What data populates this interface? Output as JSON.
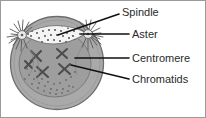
{
  "figure": {
    "background_color": "#ffffff",
    "border_color": "#9a9a9a",
    "cell": {
      "name": "dividing-cell",
      "fill_color": "#a9a9a9",
      "outline_color": "#6e6e6e",
      "center_x": 56,
      "center_y": 62,
      "radius": 47
    },
    "nucleus": {
      "name": "nuclear-region",
      "fill_color": "#9c9c9c",
      "outline_color": "#7a7a7a"
    },
    "spindle_shape": {
      "name": "spindle-apparatus",
      "fill_color": "#f2f2f2",
      "outline_color": "#777777",
      "stipple_color": "#4a4a4a"
    },
    "aster_color": "#5a5a5a",
    "aster_center_fill": "#e8e8e8",
    "chromosome_color": "#4e4e4e"
  },
  "labels": [
    {
      "id": "spindle",
      "text": "Spindle",
      "x": 121,
      "y": 12,
      "leader": "M 57,34 L 118,13"
    },
    {
      "id": "aster",
      "text": "Aster",
      "x": 131,
      "y": 34,
      "leader": "M 80,33 L 128,33"
    },
    {
      "id": "centromere",
      "text": "Centromere",
      "x": 131,
      "y": 58,
      "leader": "M 74,57 L 128,57"
    },
    {
      "id": "chromatids",
      "text": "Chromatids",
      "x": 131,
      "y": 79,
      "leader": "M 70,64 L 128,78"
    }
  ]
}
